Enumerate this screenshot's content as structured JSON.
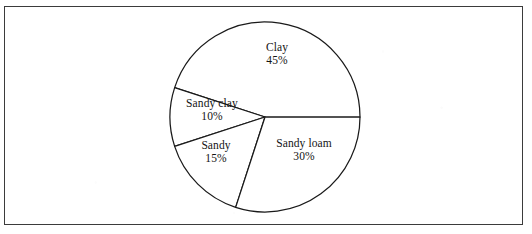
{
  "figure": {
    "background_color": "#ffffff",
    "border_color": "#3b3b3b",
    "line_color": "#1a1a1a"
  },
  "chart_data": {
    "type": "pie",
    "title": "",
    "subtitle": "",
    "xlabel": "",
    "ylabel": "",
    "legend": "none",
    "grid": false,
    "start_angle_deg": 0,
    "direction": "counterclockwise",
    "unit": "%",
    "categories": [
      "Clay",
      "Sandy loam",
      "Sandy",
      "Sandy clay"
    ],
    "values": [
      45,
      30,
      15,
      10
    ],
    "slices": [
      {
        "name": "Clay",
        "value": 45,
        "label_name": "Clay",
        "label_value": "45%",
        "start_deg": 0,
        "end_deg": 162,
        "label_x": 277,
        "label_y": 54,
        "fill": "#ffffff"
      },
      {
        "name": "Sandy clay",
        "value": 10,
        "label_name": "Sandy clay",
        "label_value": "10%",
        "start_deg": 162,
        "end_deg": 198,
        "label_x": 212,
        "label_y": 110,
        "fill": "#ffffff"
      },
      {
        "name": "Sandy",
        "value": 15,
        "label_name": "Sandy",
        "label_value": "15%",
        "start_deg": 198,
        "end_deg": 252,
        "label_x": 216,
        "label_y": 152,
        "fill": "#ffffff"
      },
      {
        "name": "Sandy loam",
        "value": 30,
        "label_name": "Sandy loam",
        "label_value": "30%",
        "start_deg": 252,
        "end_deg": 360,
        "label_x": 304,
        "label_y": 150,
        "fill": "#ffffff"
      }
    ],
    "geometry": {
      "center_x": 265,
      "center_y": 117,
      "radius": 95
    }
  }
}
